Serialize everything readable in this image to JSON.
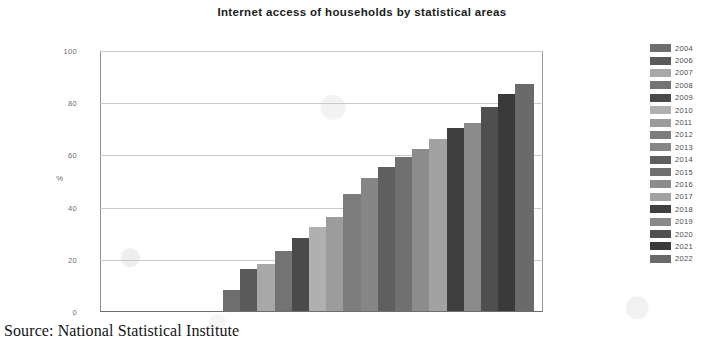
{
  "chart_data": {
    "type": "bar",
    "title": "Internet access of households by statistical areas",
    "xlabel": "",
    "ylabel": "%",
    "ylim": [
      0,
      100
    ],
    "yticks": [
      0,
      20,
      40,
      60,
      80,
      100
    ],
    "grid": true,
    "legend_position": "right",
    "categories": [
      "2004",
      "2006",
      "2007",
      "2008",
      "2009",
      "2010",
      "2011",
      "2012",
      "2013",
      "2014",
      "2015",
      "2016",
      "2017",
      "2018",
      "2019",
      "2020",
      "2021",
      "2022"
    ],
    "values": [
      8,
      16,
      18,
      23,
      28,
      32,
      36,
      45,
      51,
      55,
      59,
      62,
      66,
      70,
      72,
      78,
      83,
      87
    ],
    "colors": [
      "#6e6e6e",
      "#5a5a5a",
      "#a8a8a8",
      "#737373",
      "#4a4a4a",
      "#b0b0b0",
      "#9c9c9c",
      "#7c7c7c",
      "#868686",
      "#5f5f5f",
      "#707070",
      "#8c8c8c",
      "#a2a2a2",
      "#3f3f3f",
      "#8a8a8a",
      "#4f4f4f",
      "#3a3a3a",
      "#6a6a6a"
    ]
  },
  "source": {
    "text": "Source: National Statistical Institute"
  }
}
